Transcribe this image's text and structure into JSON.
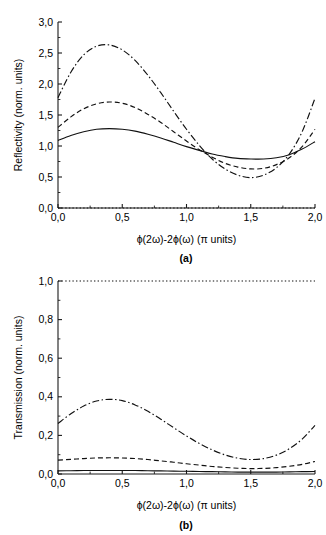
{
  "figure": {
    "panel_a_label": "(a)",
    "panel_b_label": "(b)"
  },
  "chart_data": [
    {
      "type": "line",
      "panel": "(a)",
      "title": "",
      "xlabel": "ϕ(2ω)-2ϕ(ω) (π units)",
      "ylabel": "Reflectivity (norm. units)",
      "xlim": [
        0.0,
        2.0
      ],
      "ylim": [
        0.0,
        3.0
      ],
      "xticks": [
        0.0,
        0.5,
        1.0,
        1.5,
        2.0
      ],
      "xtick_labels": [
        "0,0",
        "0,5",
        "1,0",
        "1,5",
        "2,0"
      ],
      "yticks": [
        0.0,
        0.5,
        1.0,
        1.5,
        2.0,
        2.5,
        3.0
      ],
      "ytick_labels": [
        "0,0",
        "0,5",
        "1,0",
        "1,5",
        "2,0",
        "2,5",
        "3,0"
      ],
      "grid": false,
      "legend": "none",
      "x": [
        0.0,
        0.1,
        0.2,
        0.3,
        0.4,
        0.5,
        0.6,
        0.7,
        0.8,
        0.9,
        1.0,
        1.1,
        1.2,
        1.3,
        1.4,
        1.5,
        1.6,
        1.7,
        1.8,
        1.9,
        2.0
      ],
      "series": [
        {
          "name": "dotted-baseline",
          "style": "dotted",
          "values": [
            0.0,
            0.0,
            0.0,
            0.0,
            0.0,
            0.0,
            0.0,
            0.0,
            0.0,
            0.0,
            0.0,
            0.0,
            0.0,
            0.0,
            0.0,
            0.0,
            0.0,
            0.0,
            0.0,
            0.0,
            0.0
          ]
        },
        {
          "name": "solid-curve",
          "style": "solid",
          "values": [
            1.09,
            1.17,
            1.23,
            1.27,
            1.28,
            1.27,
            1.24,
            1.19,
            1.13,
            1.06,
            0.99,
            0.93,
            0.87,
            0.83,
            0.8,
            0.79,
            0.79,
            0.81,
            0.86,
            0.95,
            1.07
          ]
        },
        {
          "name": "dashed-curve",
          "style": "dashed",
          "values": [
            1.3,
            1.47,
            1.6,
            1.68,
            1.71,
            1.69,
            1.62,
            1.51,
            1.38,
            1.23,
            1.08,
            0.94,
            0.82,
            0.72,
            0.66,
            0.63,
            0.64,
            0.7,
            0.81,
            0.99,
            1.27
          ]
        },
        {
          "name": "dash-dot-curve",
          "style": "dashdot",
          "values": [
            1.78,
            2.19,
            2.47,
            2.61,
            2.63,
            2.55,
            2.38,
            2.14,
            1.86,
            1.56,
            1.27,
            1.01,
            0.79,
            0.63,
            0.53,
            0.49,
            0.53,
            0.65,
            0.87,
            1.23,
            1.77
          ]
        }
      ]
    },
    {
      "type": "line",
      "panel": "(b)",
      "title": "",
      "xlabel": "ϕ(2ω)-2ϕ(ω) (π units)",
      "ylabel": "Transmission (norm. units)",
      "xlim": [
        0.0,
        2.0
      ],
      "ylim": [
        0.0,
        1.0
      ],
      "xticks": [
        0.0,
        0.5,
        1.0,
        1.5,
        2.0
      ],
      "xtick_labels": [
        "0,0",
        "0,5",
        "1,0",
        "1,5",
        "2,0"
      ],
      "yticks": [
        0.0,
        0.2,
        0.4,
        0.6,
        0.8,
        1.0
      ],
      "ytick_labels": [
        "0,0",
        "0,2",
        "0,4",
        "0,6",
        "0,8",
        "1,0"
      ],
      "grid": false,
      "legend": "none",
      "x": [
        0.0,
        0.1,
        0.2,
        0.3,
        0.4,
        0.5,
        0.6,
        0.7,
        0.8,
        0.9,
        1.0,
        1.1,
        1.2,
        1.3,
        1.4,
        1.5,
        1.6,
        1.7,
        1.8,
        1.9,
        2.0
      ],
      "series": [
        {
          "name": "dotted-baseline",
          "style": "dotted",
          "values": [
            1.0,
            1.0,
            1.0,
            1.0,
            1.0,
            1.0,
            1.0,
            1.0,
            1.0,
            1.0,
            1.0,
            1.0,
            1.0,
            1.0,
            1.0,
            1.0,
            1.0,
            1.0,
            1.0,
            1.0,
            1.0
          ]
        },
        {
          "name": "solid-curve",
          "style": "solid",
          "values": [
            0.016,
            0.017,
            0.018,
            0.018,
            0.018,
            0.018,
            0.018,
            0.017,
            0.016,
            0.015,
            0.014,
            0.013,
            0.012,
            0.011,
            0.01,
            0.01,
            0.01,
            0.01,
            0.011,
            0.012,
            0.013
          ]
        },
        {
          "name": "dashed-curve",
          "style": "dashed",
          "values": [
            0.072,
            0.076,
            0.08,
            0.083,
            0.084,
            0.083,
            0.08,
            0.075,
            0.068,
            0.061,
            0.053,
            0.046,
            0.039,
            0.034,
            0.03,
            0.028,
            0.029,
            0.033,
            0.04,
            0.05,
            0.065
          ]
        },
        {
          "name": "dash-dot-curve",
          "style": "dashdot",
          "values": [
            0.262,
            0.312,
            0.352,
            0.378,
            0.387,
            0.38,
            0.358,
            0.325,
            0.284,
            0.24,
            0.197,
            0.158,
            0.125,
            0.099,
            0.082,
            0.075,
            0.08,
            0.098,
            0.131,
            0.181,
            0.252
          ]
        }
      ]
    }
  ]
}
